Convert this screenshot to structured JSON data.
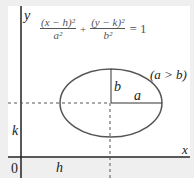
{
  "diagram": {
    "equation": {
      "term1_num": "(x − h)²",
      "term1_den": "a²",
      "plus": "+",
      "term2_num": "(y − k)²",
      "term2_den": "b²",
      "rhs": "= 1"
    },
    "axes": {
      "x_label": "x",
      "y_label": "y",
      "origin_label": "0"
    },
    "center_labels": {
      "h": "h",
      "k": "k"
    },
    "semi_axes": {
      "a": "a",
      "b": "b"
    },
    "condition": "(a > b)",
    "colors": {
      "axis": "#222222",
      "ellipse": "#555555",
      "dashed": "#555555",
      "background": "#efefef"
    }
  }
}
